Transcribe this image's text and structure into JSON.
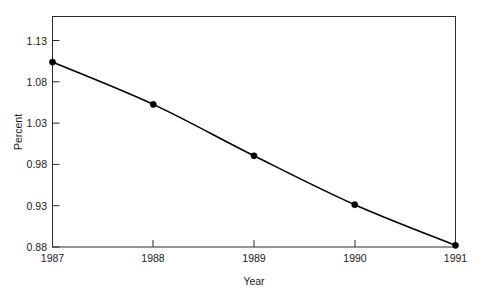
{
  "chart_data": {
    "type": "line",
    "title": "",
    "xlabel": "Year",
    "ylabel": "Percent",
    "categories": [
      "1987",
      "1988",
      "1989",
      "1990",
      "1991"
    ],
    "x": [
      1987,
      1988,
      1989,
      1990,
      1991
    ],
    "values": [
      1.103,
      1.052,
      0.99,
      0.931,
      0.882
    ],
    "series": [
      {
        "name": "Percent",
        "values": [
          1.103,
          1.052,
          0.99,
          0.931,
          0.882
        ]
      }
    ],
    "xlim": [
      1987,
      1991
    ],
    "ylim": [
      0.88,
      1.158
    ],
    "ytick_labels": [
      "1.13",
      "1.08",
      "1.03",
      "0.98",
      "0.93",
      "0.88"
    ],
    "ytick_values": [
      1.13,
      1.08,
      1.03,
      0.98,
      0.93,
      0.88
    ],
    "xtick_labels": [
      "1987",
      "1988",
      "1989",
      "1990",
      "1991"
    ],
    "grid": false,
    "legend": false,
    "legend_position": "none",
    "marker": "filled-circle",
    "line_color": "#000000",
    "marker_color": "#000000",
    "background_color": "#ffffff",
    "smoothing": "spline"
  }
}
